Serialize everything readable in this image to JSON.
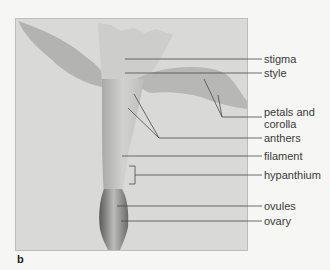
{
  "figure": {
    "panel_letter": "b",
    "labels": [
      {
        "id": "stigma",
        "text": "stigma"
      },
      {
        "id": "style",
        "text": "style"
      },
      {
        "id": "petals",
        "text": "petals and corolla",
        "line1": "petals and",
        "line2": "corolla"
      },
      {
        "id": "anthers",
        "text": "anthers"
      },
      {
        "id": "filament",
        "text": "filament"
      },
      {
        "id": "hypanthium",
        "text": "hypanthium"
      },
      {
        "id": "ovules",
        "text": "ovules"
      },
      {
        "id": "ovary",
        "text": "ovary"
      }
    ],
    "colors": {
      "page_background": "#f6f6f4",
      "photo_background": "#d9d9d7",
      "leader_lines": "#4a4a4a",
      "label_text": "#3a3a3a"
    }
  }
}
